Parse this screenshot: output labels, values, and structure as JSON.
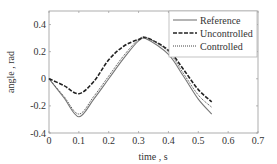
{
  "chart_data": {
    "type": "line",
    "title": "",
    "xlabel": "time , s",
    "ylabel": "angle , rad",
    "xlim": [
      0,
      0.7
    ],
    "ylim": [
      -0.4,
      0.5
    ],
    "xticks": [
      0,
      0.1,
      0.2,
      0.3,
      0.4,
      0.5,
      0.6,
      0.7
    ],
    "xtick_labels": [
      "0",
      "0.1",
      "0.2",
      "0.3",
      "0.4",
      "0.5",
      "0.6",
      "0.7"
    ],
    "yticks": [
      -0.4,
      -0.2,
      0,
      0.2,
      0.4
    ],
    "ytick_labels": [
      "-0.4",
      "-0.2",
      "0",
      "0.2",
      "0.4"
    ],
    "grid": false,
    "legend_position": "upper right",
    "x": [
      0,
      0.05,
      0.1,
      0.15,
      0.2,
      0.25,
      0.3,
      0.33,
      0.4,
      0.45,
      0.5,
      0.545
    ],
    "series": [
      {
        "name": "Reference",
        "style": "solid",
        "color": "#777777",
        "values": [
          0,
          -0.14,
          -0.28,
          -0.15,
          0.0,
          0.15,
          0.28,
          0.29,
          0.18,
          0.02,
          -0.15,
          -0.26
        ]
      },
      {
        "name": "Uncontrolled",
        "style": "dashed",
        "color": "#222222",
        "values": [
          0,
          -0.05,
          -0.11,
          -0.02,
          0.14,
          0.24,
          0.29,
          0.3,
          0.21,
          0.07,
          -0.08,
          -0.17
        ]
      },
      {
        "name": "Controlled",
        "style": "dotted",
        "color": "#444444",
        "values": [
          0,
          -0.13,
          -0.26,
          -0.13,
          0.02,
          0.17,
          0.29,
          0.3,
          0.2,
          0.04,
          -0.12,
          -0.21
        ]
      }
    ]
  }
}
